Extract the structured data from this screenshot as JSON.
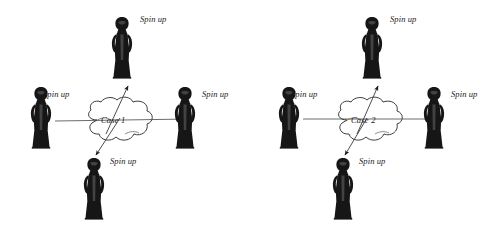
{
  "figure": {
    "type": "diagram",
    "background_color": "#ffffff",
    "ink_color": "#1a1a1a",
    "line_color": "#555555",
    "panel_count": 2,
    "caption": ""
  },
  "panels": [
    {
      "id": "case-1",
      "cloud_label": "Case 1",
      "icon": "statue-figurine",
      "nodes": [
        {
          "position": "top",
          "label": "Spin up",
          "label_side": "right"
        },
        {
          "position": "left",
          "label": "Spin up",
          "label_side": "right"
        },
        {
          "position": "right",
          "label": "Spin up",
          "label_side": "right"
        },
        {
          "position": "bottom",
          "label": "Spin up",
          "label_side": "right"
        }
      ],
      "connectors": [
        {
          "kind": "line",
          "from": "left",
          "to": "right",
          "orientation": "horizontal",
          "arrowheads": "none"
        },
        {
          "kind": "arrow",
          "from": "cloud",
          "to": "top-right",
          "orientation": "diagonal-up",
          "arrowheads": "end"
        },
        {
          "kind": "arrow",
          "from": "cloud",
          "to": "bottom-left",
          "orientation": "diagonal-down",
          "arrowheads": "end"
        }
      ]
    },
    {
      "id": "case-2",
      "cloud_label": "Case 2",
      "icon": "statue-figurine",
      "nodes": [
        {
          "position": "top",
          "label": "Spin up",
          "label_side": "right"
        },
        {
          "position": "left",
          "label": "Spin up",
          "label_side": "right"
        },
        {
          "position": "right",
          "label": "Spin up",
          "label_side": "right"
        },
        {
          "position": "bottom",
          "label": "Spin up",
          "label_side": "right"
        }
      ],
      "connectors": [
        {
          "kind": "line",
          "from": "left",
          "to": "right",
          "orientation": "horizontal",
          "arrowheads": "none"
        },
        {
          "kind": "arrow",
          "from": "cloud",
          "to": "top-right",
          "orientation": "diagonal-up",
          "arrowheads": "end"
        },
        {
          "kind": "arrow",
          "from": "cloud",
          "to": "bottom-left",
          "orientation": "diagonal-down",
          "arrowheads": "end"
        }
      ]
    }
  ],
  "labels": {
    "spin_up": "Spin up",
    "case_1": "Case 1",
    "case_2": "Case 2"
  }
}
